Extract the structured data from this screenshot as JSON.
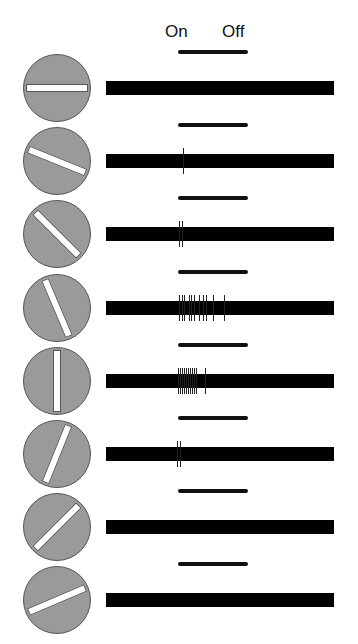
{
  "header": {
    "on_label": "On",
    "off_label": "Off"
  },
  "colors": {
    "circle_fill": "#9a9a9a",
    "bar_fill": "#ffffff",
    "trace": "#000000"
  },
  "stimulus_period": {
    "x_start": 178,
    "x_end": 248
  },
  "rows": [
    {
      "orientation_deg": 0,
      "spike_count": 0,
      "spikes_x": []
    },
    {
      "orientation_deg": 22,
      "spike_count": 1,
      "spikes_x": [
        183
      ]
    },
    {
      "orientation_deg": 45,
      "spike_count": 2,
      "spikes_x": [
        179,
        182
      ]
    },
    {
      "orientation_deg": 67,
      "spike_count": 11,
      "spikes_x": [
        179,
        182,
        184,
        189,
        191,
        194,
        199,
        203,
        206,
        213,
        224
      ]
    },
    {
      "orientation_deg": 90,
      "spike_count": 11,
      "spikes_x": [
        178,
        180,
        182,
        184,
        186,
        188,
        190,
        192,
        194,
        196,
        205
      ]
    },
    {
      "orientation_deg": 112,
      "spike_count": 2,
      "spikes_x": [
        177,
        180
      ]
    },
    {
      "orientation_deg": 135,
      "spike_count": 0,
      "spikes_x": []
    },
    {
      "orientation_deg": 157,
      "spike_count": 0,
      "spikes_x": []
    }
  ]
}
